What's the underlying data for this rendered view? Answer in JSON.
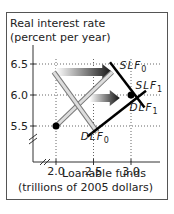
{
  "chart_data": {
    "type": "line",
    "title": "",
    "ylabel_lines": [
      "Real interest rate",
      "(percent per year)"
    ],
    "xlabel_lines": [
      "Loanable funds",
      "(trillions of 2005 dollars)"
    ],
    "xlim": [
      1.7,
      3.3
    ],
    "ylim": [
      5.1,
      6.8
    ],
    "x_ticks": [
      {
        "v": 2.0,
        "label": "2.0"
      },
      {
        "v": 2.5,
        "label": "2.5"
      },
      {
        "v": 3.0,
        "label": "3.0"
      }
    ],
    "y_ticks": [
      {
        "v": 5.5,
        "label": "5.5"
      },
      {
        "v": 6.0,
        "label": "6.0"
      },
      {
        "v": 6.5,
        "label": "6.5"
      }
    ],
    "grid": "dotted",
    "axis_breaks": true,
    "series": [
      {
        "name": "SLF0",
        "style": "double-gray",
        "points": [
          [
            2.0,
            5.5
          ],
          [
            2.75,
            6.37
          ]
        ]
      },
      {
        "name": "DLF0",
        "style": "double-gray",
        "points": [
          [
            1.97,
            6.37
          ],
          [
            2.55,
            5.4
          ]
        ]
      },
      {
        "name": "SLF1",
        "style": "black",
        "points": [
          [
            2.42,
            5.33
          ],
          [
            3.2,
            6.07
          ]
        ]
      },
      {
        "name": "DLF1",
        "style": "black",
        "points": [
          [
            2.72,
            6.53
          ],
          [
            3.18,
            5.8
          ]
        ]
      }
    ],
    "curve_labels": [
      {
        "series": "SLF0",
        "text": "SLF",
        "sub": "0",
        "x": 2.85,
        "y": 6.42
      },
      {
        "series": "SLF1",
        "text": "SLF",
        "sub": "1",
        "x": 3.06,
        "y": 6.1
      },
      {
        "series": "DLF1",
        "text": "DLF",
        "sub": "1",
        "x": 2.98,
        "y": 5.75
      },
      {
        "series": "DLF0",
        "text": "DLF",
        "sub": "0",
        "x": 2.33,
        "y": 5.28
      }
    ],
    "points": [
      {
        "name": "initial-equilibrium",
        "x": 2.0,
        "y": 5.5
      },
      {
        "name": "new-equilibrium",
        "x": 3.0,
        "y": 6.0
      }
    ],
    "arrows": [
      {
        "name": "demand-shift-arrow",
        "from": [
          2.0,
          6.37
        ],
        "to": [
          2.75,
          6.37
        ]
      },
      {
        "name": "supply-shift-arrow",
        "from": [
          2.45,
          5.95
        ],
        "to": [
          2.85,
          5.95
        ]
      }
    ]
  }
}
